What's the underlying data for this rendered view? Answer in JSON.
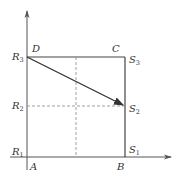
{
  "diagram": {
    "colors": {
      "line": "#444444",
      "dashed": "#888888",
      "text": "#333333"
    },
    "points": {
      "A": {
        "label": "A"
      },
      "B": {
        "label": "B"
      },
      "C": {
        "label": "C"
      },
      "D": {
        "label": "D"
      }
    },
    "y_labels": [
      {
        "base": "R",
        "sub": "3"
      },
      {
        "base": "R",
        "sub": "2"
      },
      {
        "base": "R",
        "sub": "1"
      }
    ],
    "right_labels": [
      {
        "base": "S",
        "sub": "3"
      },
      {
        "base": "S",
        "sub": "2"
      },
      {
        "base": "S",
        "sub": "1"
      }
    ]
  }
}
